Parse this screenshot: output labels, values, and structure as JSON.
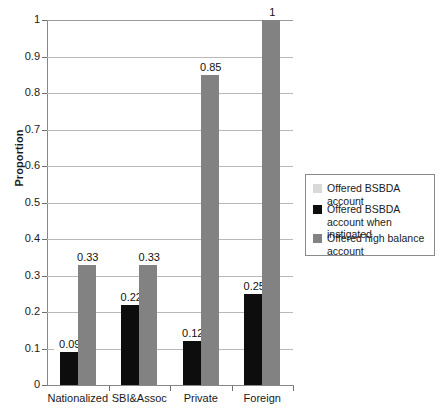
{
  "chart_data": {
    "type": "bar",
    "title": "",
    "subtitle": "",
    "xlabel": "",
    "ylabel": "Proportion",
    "ylim": [
      0,
      1
    ],
    "grid": true,
    "legend_position": "right",
    "categories": [
      "Nationalized",
      "SBI&Assoc",
      "Private",
      "Foreign"
    ],
    "y_ticks": [
      "0",
      "0.1",
      "0.2",
      "0.3",
      "0.4",
      "0.5",
      "0.6",
      "0.7",
      "0.8",
      "0.9",
      "1"
    ],
    "y_tick_values": [
      0,
      0.1,
      0.2,
      0.3,
      0.4,
      0.5,
      0.6,
      0.7,
      0.8,
      0.9,
      1
    ],
    "series": [
      {
        "name": "Offered BSBDA account",
        "color": "#d9d9d9",
        "values": [
          0,
          0,
          0,
          0
        ],
        "labels": [
          "",
          "",
          "",
          ""
        ]
      },
      {
        "name": "Offered BSBDA account when instigated",
        "color": "#0d0d0d",
        "values": [
          0.09,
          0.22,
          0.12,
          0.25
        ],
        "labels": [
          "0.09",
          "0.22",
          "0.12",
          "0.25"
        ]
      },
      {
        "name": "Offered high balance account",
        "color": "#828282",
        "values": [
          0.33,
          0.33,
          0.85,
          1
        ],
        "labels": [
          "0.33",
          "0.33",
          "0.85",
          "1"
        ]
      }
    ]
  },
  "legend": {
    "entries": [
      {
        "label": "Offered BSBDA account",
        "color": "#d9d9d9"
      },
      {
        "label": "Offered BSBDA account when instigated",
        "color": "#0d0d0d"
      },
      {
        "label": "Offered high balance account",
        "color": "#828282"
      }
    ]
  },
  "colors": {
    "series_light_gray": "#d9d9d9",
    "series_black": "#0d0d0d",
    "series_gray": "#828282",
    "gridline": "#b9b9b9",
    "axis": "#878787",
    "legend_border": "#8a8a8a",
    "text": "#1a1a1a",
    "background": "#ffffff"
  }
}
